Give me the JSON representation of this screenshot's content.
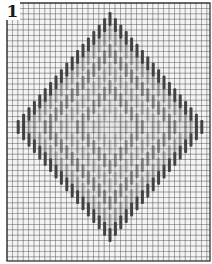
{
  "figure": {
    "label": "1"
  },
  "grid": {
    "x0": 7,
    "y0": 3,
    "x1": 210,
    "y1": 261,
    "cell": 5.4,
    "line_color": "#3a3a3a",
    "bg_color": "#f4f4f4",
    "border_color": "#222222"
  },
  "pattern": {
    "center_x": 110,
    "center_y": 127,
    "stitch_width": 3,
    "stitch_length": 14,
    "rings": [
      {
        "name": "outer-outline",
        "half_w": 92,
        "half_h": 108,
        "color": "#3c3c3c",
        "opacity": 0.95
      },
      {
        "name": "outer-band",
        "half_w": 80,
        "half_h": 94,
        "color": "#8a8a8a",
        "opacity": 0.55
      },
      {
        "name": "inner-outline",
        "half_w": 64,
        "half_h": 76,
        "color": "#707070",
        "opacity": 0.7
      },
      {
        "name": "inner-band",
        "half_w": 48,
        "half_h": 58,
        "color": "#9a9a9a",
        "opacity": 0.55
      },
      {
        "name": "center-outline",
        "half_w": 32,
        "half_h": 40,
        "color": "#6a6a6a",
        "opacity": 0.6
      },
      {
        "name": "center-fill",
        "half_w": 16,
        "half_h": 20,
        "color": "#a8a8a8",
        "opacity": 0.5
      }
    ],
    "fill_color": "#e6e6e6"
  }
}
